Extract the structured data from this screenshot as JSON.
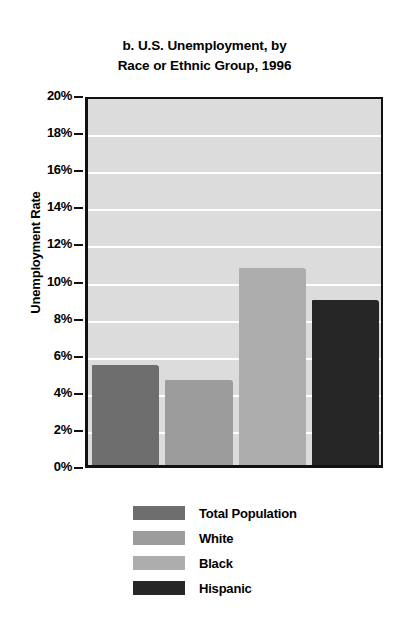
{
  "chart_data": {
    "type": "bar",
    "title": "b. U.S. Unemployment, by Race or Ethnic Group, 1996",
    "title_lines": [
      "b. U.S. Unemployment, by",
      "Race or Ethnic Group, 1996"
    ],
    "xlabel": "",
    "ylabel": "Unemployment Rate",
    "ylim": [
      0,
      20
    ],
    "ytick_step": 2,
    "ytick_labels": [
      "20%",
      "18%",
      "16%",
      "14%",
      "12%",
      "10%",
      "8%",
      "6%",
      "4%",
      "2%",
      "0%"
    ],
    "ytick_values": [
      20,
      18,
      16,
      14,
      12,
      10,
      8,
      6,
      4,
      2,
      0
    ],
    "grid": true,
    "grid_color": "#ffffff",
    "plot_background": "#dcdcdc",
    "legend_position": "below",
    "categories": [
      "Total Population",
      "White",
      "Black",
      "Hispanic"
    ],
    "values": [
      5.4,
      4.6,
      10.6,
      8.9
    ],
    "value_unit": "%",
    "colors": [
      "#6e6e6e",
      "#9c9c9c",
      "#adadad",
      "#262626"
    ],
    "series": [
      {
        "name": "U.S. Unemployment Rate 1996",
        "values": [
          5.4,
          4.6,
          10.6,
          8.9
        ]
      }
    ],
    "bars": [
      {
        "label": "Total Population",
        "value": 5.4,
        "color": "#6e6e6e"
      },
      {
        "label": "White",
        "value": 4.6,
        "color": "#9c9c9c"
      },
      {
        "label": "Black",
        "value": 10.6,
        "color": "#adadad"
      },
      {
        "label": "Hispanic",
        "value": 8.9,
        "color": "#262626"
      }
    ],
    "legend": [
      {
        "label": "Total Population",
        "color": "#6e6e6e"
      },
      {
        "label": "White",
        "color": "#9c9c9c"
      },
      {
        "label": "Black",
        "color": "#adadad"
      },
      {
        "label": "Hispanic",
        "color": "#262626"
      }
    ]
  }
}
